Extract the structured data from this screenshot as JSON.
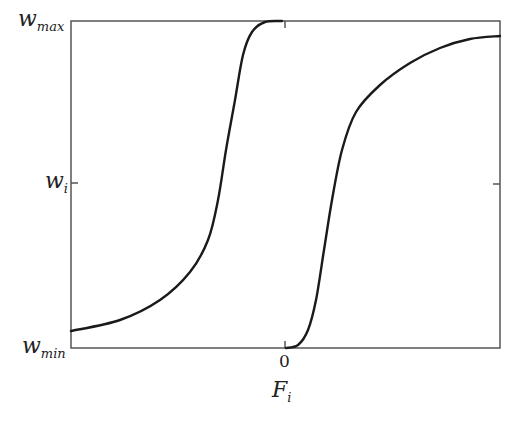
{
  "chart_data": {
    "type": "line",
    "title": "",
    "xlabel": "F_i",
    "ylabel": "",
    "x_ticks": [
      {
        "value": 0,
        "label": "0"
      }
    ],
    "y_ticks": [
      {
        "label": "w_min",
        "position": "bottom"
      },
      {
        "label": "w_i",
        "position": "middle"
      },
      {
        "label": "w_max",
        "position": "top"
      }
    ],
    "grid": false,
    "legend": null,
    "series": [
      {
        "name": "left-shifted sigmoid",
        "description": "Rises from near w_min at far left, steep rise before F_i=0, saturates at w_max just left of 0",
        "points_px": [
          [
            71,
            331
          ],
          [
            120,
            320
          ],
          [
            160,
            300
          ],
          [
            190,
            272
          ],
          [
            208,
            240
          ],
          [
            218,
            200
          ],
          [
            226,
            150
          ],
          [
            235,
            100
          ],
          [
            243,
            55
          ],
          [
            252,
            32
          ],
          [
            265,
            22
          ],
          [
            282,
            21
          ]
        ]
      },
      {
        "name": "right-shifted sigmoid",
        "description": "Starts at w_min at F_i=0, steep rise to the right of 0, approaches w_max asymptotically at far right",
        "points_px": [
          [
            286,
            348
          ],
          [
            298,
            345
          ],
          [
            308,
            330
          ],
          [
            316,
            300
          ],
          [
            324,
            250
          ],
          [
            332,
            200
          ],
          [
            342,
            150
          ],
          [
            356,
            112
          ],
          [
            380,
            85
          ],
          [
            410,
            63
          ],
          [
            440,
            48
          ],
          [
            470,
            39
          ],
          [
            500,
            36
          ]
        ]
      }
    ]
  },
  "labels": {
    "w_max": {
      "base": "w",
      "sub": "max"
    },
    "w_i": {
      "base": "w",
      "sub": "i"
    },
    "w_min": {
      "base": "w",
      "sub": "min"
    },
    "x_zero": "0",
    "x_axis": {
      "base": "F",
      "sub": "i"
    }
  },
  "colors": {
    "axis": "#444444",
    "curve": "#1a1a1a"
  }
}
